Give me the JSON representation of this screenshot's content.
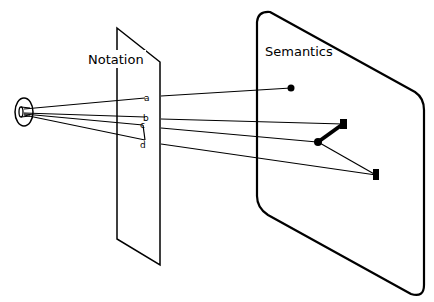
{
  "diagram": {
    "planes": {
      "notation": {
        "label": "Notation"
      },
      "semantics": {
        "label": "Semantics"
      }
    },
    "ray_labels": [
      "a",
      "b",
      "c",
      "d"
    ],
    "colors": {
      "stroke": "#000000",
      "background": "#ffffff"
    }
  }
}
